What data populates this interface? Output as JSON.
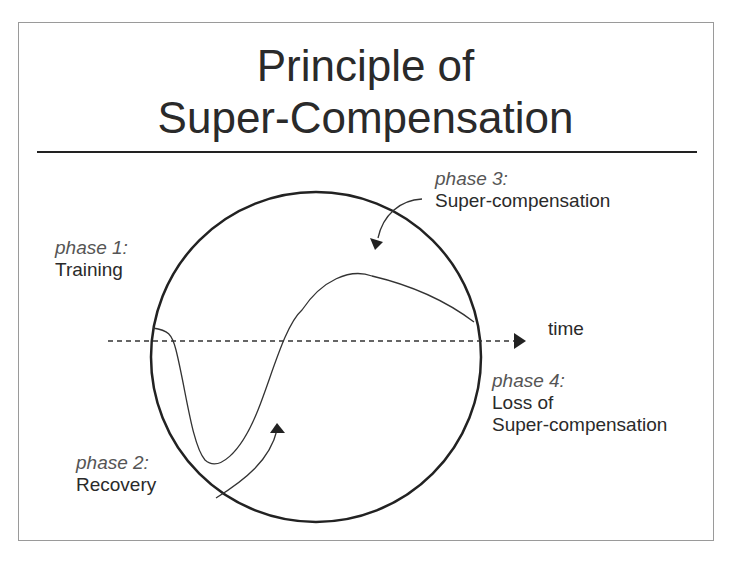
{
  "title": {
    "line1": "Principle of",
    "line2": "Super-Compensation"
  },
  "axis": {
    "label": "time"
  },
  "phases": [
    {
      "phase": "phase 1:",
      "name": "Training"
    },
    {
      "phase": "phase 2:",
      "name": "Recovery"
    },
    {
      "phase": "phase 3:",
      "name": "Super-compensation"
    },
    {
      "phase": "phase 4:",
      "name_line1": "Loss of",
      "name_line2": "Super-compensation"
    }
  ],
  "colors": {
    "text": "#2a2a2a",
    "phase_label": "#555555",
    "line": "#222222",
    "frame": "#9a9a9a"
  }
}
